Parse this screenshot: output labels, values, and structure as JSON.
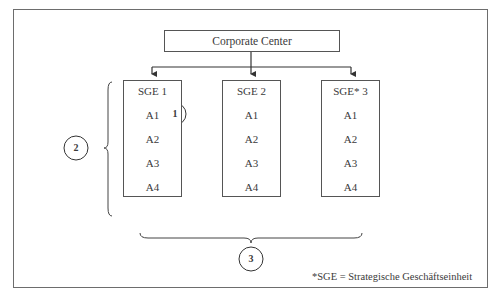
{
  "diagram": {
    "corporate_center": {
      "label": "Corporate Center"
    },
    "units": [
      {
        "title": "SGE 1",
        "items": [
          "A1",
          "A2",
          "A3",
          "A4"
        ]
      },
      {
        "title": "SGE 2",
        "items": [
          "A1",
          "A2",
          "A3",
          "A4"
        ]
      },
      {
        "title": "SGE* 3",
        "items": [
          "A1",
          "A2",
          "A3",
          "A4"
        ]
      }
    ],
    "markers": {
      "activity_marker": "1",
      "vertical_brace_marker": "2",
      "horizontal_brace_marker": "3"
    },
    "footnote": "*SGE = Strategische Geschäftseinheit",
    "colors": {
      "line": "#3f3f3f",
      "frame": "#6d6d6d",
      "text": "#3a3a3a",
      "background": "#ffffff"
    }
  }
}
